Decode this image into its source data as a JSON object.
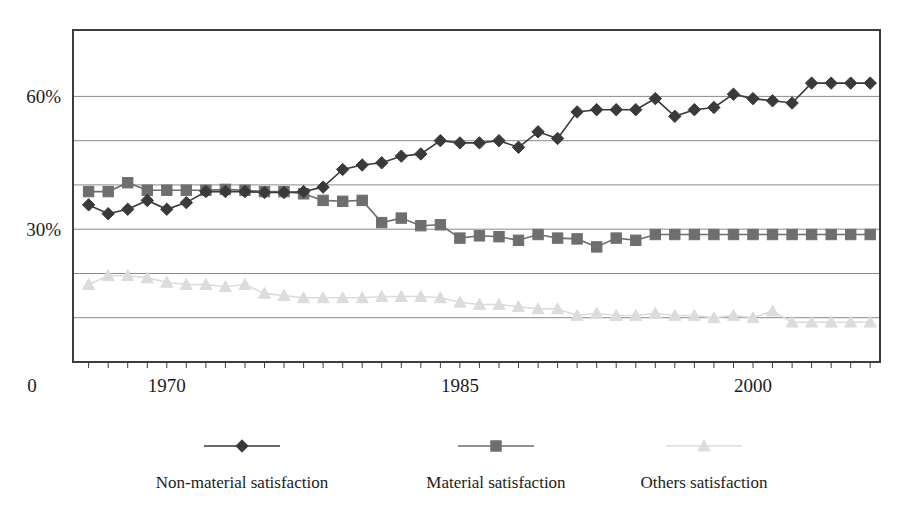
{
  "chart_data": {
    "type": "line",
    "title": "",
    "subtitle": "",
    "xlabel": "",
    "ylabel": "",
    "grid": true,
    "legend_position": "bottom",
    "xlim": [
      1965.2,
      2006.5
    ],
    "ylim": [
      0,
      75
    ],
    "x_tick_labels": [
      "1970",
      "1985",
      "2000"
    ],
    "x_tick_values": [
      1970,
      1985,
      2000
    ],
    "x_minor_tick_step": 1,
    "y_tick_labels": [
      "30%",
      "60%"
    ],
    "y_tick_values": [
      30,
      60
    ],
    "y_gridline_values": [
      10,
      20,
      30,
      40,
      50,
      60,
      75
    ],
    "origin_label": "0",
    "x": [
      1966,
      1967,
      1968,
      1969,
      1970,
      1971,
      1972,
      1973,
      1974,
      1975,
      1976,
      1977,
      1978,
      1979,
      1980,
      1981,
      1982,
      1983,
      1984,
      1985,
      1986,
      1987,
      1988,
      1989,
      1990,
      1991,
      1992,
      1993,
      1994,
      1995,
      1996,
      1997,
      1998,
      1999,
      2000,
      2001,
      2002,
      2003,
      2004,
      2005,
      2006
    ],
    "series": [
      {
        "name": "Non-material satisfaction",
        "marker": "diamond",
        "color": "#3a3a3a",
        "values": [
          35.5,
          33.5,
          34.5,
          36.5,
          34.5,
          36.0,
          38.5,
          38.5,
          38.5,
          38.3,
          38.3,
          38.5,
          39.5,
          43.5,
          44.5,
          45.0,
          46.5,
          47.0,
          50.0,
          49.5,
          49.5,
          50.0,
          48.5,
          52.0,
          50.5,
          56.5,
          57.0,
          57.0,
          57.0,
          59.5,
          55.5,
          57.0,
          57.5,
          60.5,
          59.5,
          59.0,
          58.5,
          63.0,
          63.0,
          63.0,
          63.0
        ]
      },
      {
        "name": "Material satisfaction",
        "marker": "square",
        "color": "#6e6e6e",
        "values": [
          38.5,
          38.5,
          40.5,
          38.8,
          38.8,
          38.8,
          38.8,
          39.0,
          38.8,
          38.5,
          38.5,
          38.0,
          36.5,
          36.3,
          36.5,
          31.5,
          32.5,
          30.8,
          31.0,
          28.0,
          28.5,
          28.3,
          27.5,
          28.8,
          28.0,
          27.8,
          26.0,
          28.0,
          27.5,
          28.8,
          28.8,
          28.8,
          28.8,
          28.8,
          28.8,
          28.8,
          28.8,
          28.8,
          28.8,
          28.8,
          28.8
        ]
      },
      {
        "name": "Others satisfaction",
        "marker": "triangle",
        "color": "#dcdcdc",
        "values": [
          17.5,
          19.5,
          19.5,
          19.0,
          18.0,
          17.5,
          17.5,
          17.0,
          17.5,
          15.5,
          15.0,
          14.5,
          14.5,
          14.5,
          14.5,
          14.8,
          14.8,
          14.8,
          14.5,
          13.5,
          13.0,
          13.0,
          12.5,
          12.0,
          12.0,
          10.5,
          11.0,
          10.5,
          10.5,
          11.0,
          10.5,
          10.5,
          10.0,
          10.5,
          10.0,
          11.5,
          9.0,
          9.0,
          9.0,
          9.0,
          9.0
        ]
      }
    ],
    "legend": [
      {
        "label": "Non-material satisfaction",
        "marker": "diamond",
        "color": "#3a3a3a"
      },
      {
        "label": "Material satisfaction",
        "marker": "square",
        "color": "#6e6e6e"
      },
      {
        "label": "Others satisfaction",
        "marker": "triangle",
        "color": "#dcdcdc"
      }
    ],
    "colors": {
      "axis": "#3d3d3d",
      "gridline": "#8a8a8a",
      "background": "#ffffff",
      "text": "#1c1c1c"
    }
  }
}
